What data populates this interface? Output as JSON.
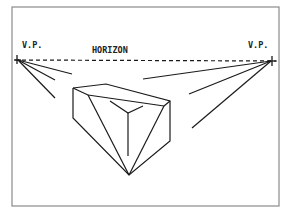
{
  "diagram": {
    "labels": {
      "left_vp": "V.P.",
      "right_vp": "V.P.",
      "horizon": "HORIZON"
    },
    "colors": {
      "ink": "#1a1a1a",
      "frame": "#8a8a8a",
      "background": "#ffffff"
    },
    "nodes": [
      {
        "id": "left-vanishing-point",
        "label": "V.P."
      },
      {
        "id": "right-vanishing-point",
        "label": "V.P."
      },
      {
        "id": "box",
        "label": ""
      }
    ],
    "edges": [
      {
        "from": "left-vanishing-point",
        "to": "right-vanishing-point",
        "label": "HORIZON",
        "style": "dashed"
      }
    ]
  }
}
